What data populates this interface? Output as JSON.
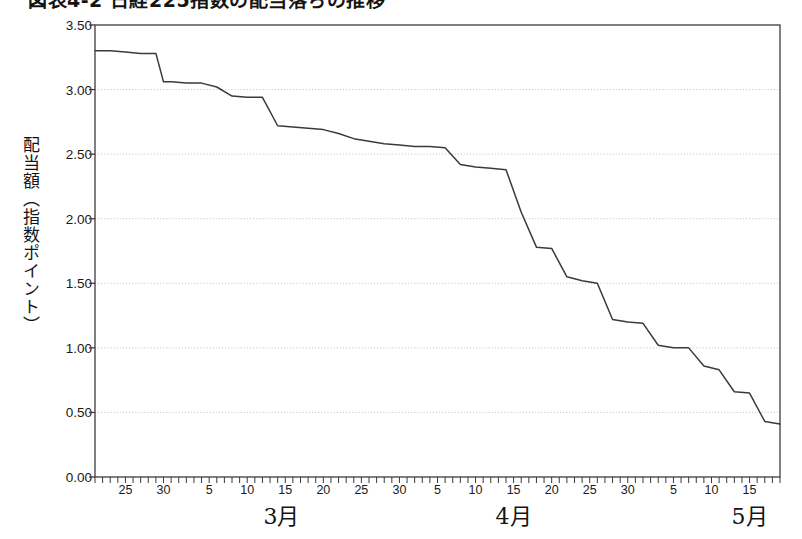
{
  "figure": {
    "title": "図表4-2 日経225指数の配当落ちの推移",
    "width": 802,
    "height": 539,
    "background": "#ffffff"
  },
  "chart_data": {
    "type": "line",
    "title": "図表4-2 日経225指数の配当落ちの推移",
    "xlabel": "",
    "ylabel": "配当額（指数ポイント）",
    "ylim": [
      0.0,
      3.5
    ],
    "yticks": [
      "0.00",
      "0.50",
      "1.00",
      "1.50",
      "2.00",
      "2.50",
      "3.00",
      "3.50"
    ],
    "ytick_values": [
      0.0,
      0.5,
      1.0,
      1.5,
      2.0,
      2.5,
      3.0,
      3.5
    ],
    "grid": "horizontal-dotted",
    "legend": "none",
    "line_color": "#3a3a3a",
    "x_axis": {
      "months": [
        "3月",
        "4月",
        "5月",
        "6月"
      ],
      "month_positions": [
        24.5,
        55,
        86,
        168
      ],
      "tick_interval_days": 1,
      "label_interval_days": 5,
      "day_labels": [
        {
          "day": 25,
          "month": "3月"
        },
        {
          "day": 30,
          "month": "3月"
        },
        {
          "day": 5,
          "month": "4月"
        },
        {
          "day": 10,
          "month": "4月"
        },
        {
          "day": 15,
          "month": "4月"
        },
        {
          "day": 20,
          "month": "4月"
        },
        {
          "day": 25,
          "month": "4月"
        },
        {
          "day": 30,
          "month": "4月"
        },
        {
          "day": 5,
          "month": "5月"
        },
        {
          "day": 10,
          "month": "5月"
        },
        {
          "day": 15,
          "month": "5月"
        },
        {
          "day": 20,
          "month": "5月"
        },
        {
          "day": 25,
          "month": "5月"
        },
        {
          "day": 30,
          "month": "5月"
        },
        {
          "day": 5,
          "month": "6月"
        },
        {
          "day": 10,
          "month": "6月"
        },
        {
          "day": 15,
          "month": "6月"
        }
      ],
      "start": "3月21日",
      "end": "6月18日",
      "total_days": 90
    },
    "x": [
      0,
      2,
      4,
      6,
      8,
      9,
      10,
      12,
      14,
      16,
      18,
      20,
      22,
      24,
      26,
      28,
      30,
      32,
      34,
      36,
      38,
      40,
      42,
      44,
      46,
      48,
      50,
      52,
      54,
      56,
      58,
      60,
      62,
      64,
      66,
      68,
      70,
      72,
      74,
      76,
      78,
      80,
      82,
      84,
      86,
      88,
      90
    ],
    "values": [
      3.3,
      3.3,
      3.29,
      3.28,
      3.28,
      3.06,
      3.06,
      3.05,
      3.05,
      3.02,
      2.95,
      2.94,
      2.94,
      2.72,
      2.71,
      2.7,
      2.69,
      2.66,
      2.62,
      2.6,
      2.58,
      2.57,
      2.56,
      2.56,
      2.55,
      2.42,
      2.4,
      2.39,
      2.38,
      2.05,
      1.78,
      1.77,
      1.55,
      1.52,
      1.5,
      1.22,
      1.2,
      1.19,
      1.02,
      1.0,
      1.0,
      0.86,
      0.83,
      0.66,
      0.65,
      0.43,
      0.41
    ],
    "note": "monotonically decreasing step-like dividend index drop-off curve from 3.30 to 0.00"
  },
  "axis_frame": {
    "left_px": 95,
    "right_px": 780,
    "top_px": 25,
    "bottom_px": 477
  }
}
